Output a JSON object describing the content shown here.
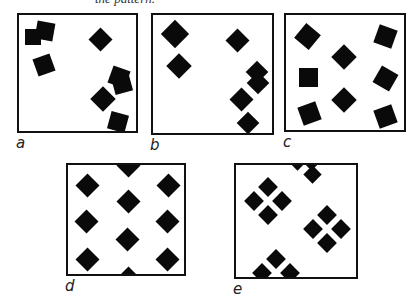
{
  "caption": "the pattern.",
  "panels": [
    {
      "id": "a",
      "label": "a",
      "x": 17,
      "y": 13,
      "w": 121,
      "h": 120,
      "squares": [
        {
          "cx": 26,
          "cy": 16,
          "s": 18,
          "r": 10
        },
        {
          "cx": 14,
          "cy": 22,
          "s": 16,
          "r": 0
        },
        {
          "cx": 25,
          "cy": 50,
          "s": 18,
          "r": -20
        },
        {
          "cx": 81,
          "cy": 24,
          "s": 17,
          "r": 45
        },
        {
          "cx": 100,
          "cy": 62,
          "s": 18,
          "r": 20
        },
        {
          "cx": 103,
          "cy": 69,
          "s": 18,
          "r": -15
        },
        {
          "cx": 84,
          "cy": 84,
          "s": 18,
          "r": 45
        },
        {
          "cx": 99,
          "cy": 107,
          "s": 18,
          "r": 15
        }
      ]
    },
    {
      "id": "b",
      "label": "b",
      "x": 151,
      "y": 13,
      "w": 123,
      "h": 122,
      "squares": [
        {
          "cx": 22,
          "cy": 19,
          "s": 20,
          "r": 45
        },
        {
          "cx": 26,
          "cy": 51,
          "s": 18,
          "r": 45
        },
        {
          "cx": 84,
          "cy": 25,
          "s": 17,
          "r": 45
        },
        {
          "cx": 104,
          "cy": 57,
          "s": 16,
          "r": 45
        },
        {
          "cx": 105,
          "cy": 68,
          "s": 16,
          "r": 45
        },
        {
          "cx": 88,
          "cy": 84,
          "s": 17,
          "r": 45
        },
        {
          "cx": 95,
          "cy": 108,
          "s": 16,
          "r": 45
        }
      ]
    },
    {
      "id": "c",
      "label": "c",
      "x": 284,
      "y": 13,
      "w": 122,
      "h": 119,
      "squares": [
        {
          "cx": 21,
          "cy": 21,
          "s": 19,
          "r": 40
        },
        {
          "cx": 99,
          "cy": 21,
          "s": 19,
          "r": 20
        },
        {
          "cx": 58,
          "cy": 42,
          "s": 18,
          "r": 45
        },
        {
          "cx": 22,
          "cy": 62,
          "s": 19,
          "r": 0
        },
        {
          "cx": 99,
          "cy": 63,
          "s": 19,
          "r": 30
        },
        {
          "cx": 58,
          "cy": 85,
          "s": 18,
          "r": 45
        },
        {
          "cx": 23,
          "cy": 98,
          "s": 19,
          "r": -20
        },
        {
          "cx": 99,
          "cy": 101,
          "s": 19,
          "r": -20
        }
      ]
    },
    {
      "id": "d",
      "label": "d",
      "x": 66,
      "y": 163,
      "w": 120,
      "h": 113,
      "squares": [
        {
          "cx": 60,
          "cy": 0,
          "s": 17,
          "r": 45
        },
        {
          "cx": 19,
          "cy": 20,
          "s": 17,
          "r": 45
        },
        {
          "cx": 100,
          "cy": 20,
          "s": 17,
          "r": 45
        },
        {
          "cx": 60,
          "cy": 36,
          "s": 17,
          "r": 45
        },
        {
          "cx": 18,
          "cy": 56,
          "s": 17,
          "r": 45
        },
        {
          "cx": 99,
          "cy": 56,
          "s": 17,
          "r": 45
        },
        {
          "cx": 59,
          "cy": 74,
          "s": 17,
          "r": 45
        },
        {
          "cx": 19,
          "cy": 94,
          "s": 17,
          "r": 45
        },
        {
          "cx": 99,
          "cy": 94,
          "s": 17,
          "r": 45
        },
        {
          "cx": 60,
          "cy": 113,
          "s": 17,
          "r": 45
        }
      ]
    },
    {
      "id": "e",
      "label": "e",
      "x": 234,
      "y": 163,
      "w": 124,
      "h": 116,
      "squares": [
        {
          "cx": 61,
          "cy": -4,
          "s": 13,
          "r": 45
        },
        {
          "cx": 75,
          "cy": -4,
          "s": 13,
          "r": 45
        },
        {
          "cx": 76,
          "cy": 9,
          "s": 13,
          "r": 45
        },
        {
          "cx": 32,
          "cy": 22,
          "s": 14,
          "r": 45
        },
        {
          "cx": 18,
          "cy": 36,
          "s": 14,
          "r": 45
        },
        {
          "cx": 46,
          "cy": 36,
          "s": 14,
          "r": 45
        },
        {
          "cx": 32,
          "cy": 50,
          "s": 14,
          "r": 45
        },
        {
          "cx": 91,
          "cy": 50,
          "s": 14,
          "r": 45
        },
        {
          "cx": 77,
          "cy": 64,
          "s": 14,
          "r": 45
        },
        {
          "cx": 105,
          "cy": 64,
          "s": 14,
          "r": 45
        },
        {
          "cx": 91,
          "cy": 78,
          "s": 14,
          "r": 45
        },
        {
          "cx": 40,
          "cy": 94,
          "s": 14,
          "r": 45
        },
        {
          "cx": 26,
          "cy": 108,
          "s": 14,
          "r": 45
        },
        {
          "cx": 54,
          "cy": 108,
          "s": 14,
          "r": 45
        }
      ]
    }
  ]
}
